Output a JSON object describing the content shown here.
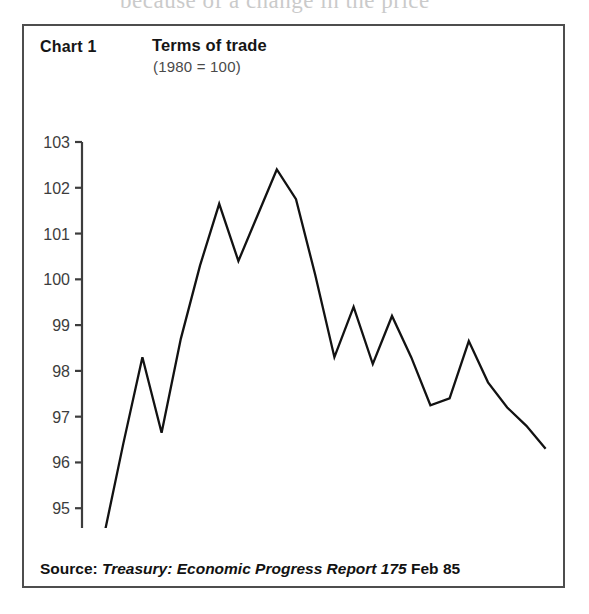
{
  "page": {
    "bleed_text": "because of a change in the price"
  },
  "chart": {
    "number_label": "Chart 1",
    "title": "Terms of trade",
    "subtitle": "(1980 = 100)",
    "source": {
      "label": "Source",
      "separator": ": ",
      "publication": "Treasury: Economic Progress Report 175",
      "date": "Feb 85",
      "full_text": "Source: Treasury: Economic Progress Report 175 Feb 85"
    },
    "colors": {
      "frame": "#4e4e4e",
      "line": "#121212",
      "axis": "#3d3d3d",
      "text": "#161616",
      "subtitle_text": "#4a4a4a",
      "background": "#ffffff"
    }
  },
  "chart_data": {
    "type": "line",
    "title": "Terms of trade",
    "subtitle": "(1980 = 100)",
    "xlabel": "",
    "ylabel": "",
    "ylim": [
      94,
      103
    ],
    "yticks": [
      94,
      95,
      96,
      97,
      98,
      99,
      100,
      101,
      102,
      103
    ],
    "xticks_major": [
      "1979",
      "1980",
      "1981",
      "1982",
      "1983",
      "1984"
    ],
    "x_tick_interval": "quarterly",
    "grid": false,
    "legend": false,
    "x": [
      "1978 Q4",
      "1979 Q1",
      "1979 Q2",
      "1979 Q3",
      "1979 Q4",
      "1980 Q1",
      "1980 Q2",
      "1980 Q3",
      "1980 Q4",
      "1981 Q1",
      "1981 Q2",
      "1981 Q3",
      "1981 Q4",
      "1982 Q1",
      "1982 Q2",
      "1982 Q3",
      "1982 Q4",
      "1983 Q1",
      "1983 Q2",
      "1983 Q3",
      "1983 Q4",
      "1984 Q1",
      "1984 Q2",
      "1984 Q3"
    ],
    "values": [
      94.4,
      96.4,
      98.3,
      96.65,
      98.7,
      100.3,
      101.65,
      100.4,
      101.4,
      102.4,
      101.75,
      100.1,
      98.3,
      99.4,
      98.15,
      99.2,
      98.3,
      97.25,
      97.4,
      98.65,
      97.75,
      97.2,
      96.8,
      96.3
    ],
    "series": [
      {
        "name": "Terms of trade",
        "values": [
          94.4,
          96.4,
          98.3,
          96.65,
          98.7,
          100.3,
          101.65,
          100.4,
          101.4,
          102.4,
          101.75,
          100.1,
          98.3,
          99.4,
          98.15,
          99.2,
          98.3,
          97.25,
          97.4,
          98.65,
          97.75,
          97.2,
          96.8,
          96.3
        ]
      }
    ],
    "annotations": []
  }
}
